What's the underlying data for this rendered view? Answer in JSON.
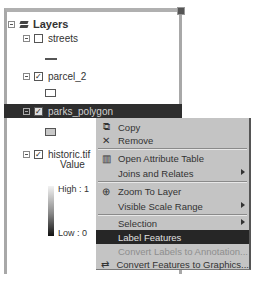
{
  "toc": {
    "root": {
      "title": "Layers",
      "icon": "layers-icon",
      "expanded": true
    },
    "layers": [
      {
        "name": "streets",
        "checked": false,
        "symbol": "line"
      },
      {
        "name": "parcel_2",
        "checked": true,
        "symbol": "hollow-polygon"
      },
      {
        "name": "parks_polygon",
        "checked": true,
        "symbol": "filled-polygon",
        "selected": true
      },
      {
        "name": "historic.tif",
        "checked": true,
        "symbol": "raster-ramp",
        "legend": {
          "field": "Value",
          "high": "High : 1",
          "low": "Low : 0"
        }
      }
    ],
    "check_mark": "✓"
  },
  "context_menu": {
    "items": [
      {
        "label": "Copy",
        "icon": "copy-icon",
        "glyph": "⧉"
      },
      {
        "label": "Remove",
        "icon": "remove-icon",
        "glyph": "✕"
      },
      {
        "label": "Open Attribute Table",
        "icon": "table-icon",
        "glyph": "▥"
      },
      {
        "label": "Joins and Relates",
        "submenu": true
      },
      {
        "label": "Zoom To Layer",
        "icon": "zoom-to-layer-icon",
        "glyph": "⊕"
      },
      {
        "label": "Visible Scale Range",
        "submenu": true
      },
      {
        "label": "Selection",
        "submenu": true
      },
      {
        "label": "Label Features",
        "highlighted": true
      },
      {
        "label": "Convert Labels to Annotation...",
        "disabled": true
      },
      {
        "label": "Convert Features to Graphics...",
        "icon": "convert-graphics-icon",
        "glyph": "⇄"
      }
    ]
  },
  "colors": {
    "selection_bg": "#2e2e2e",
    "menu_bg": "#c4c4c4",
    "menu_highlight": "#262626"
  }
}
